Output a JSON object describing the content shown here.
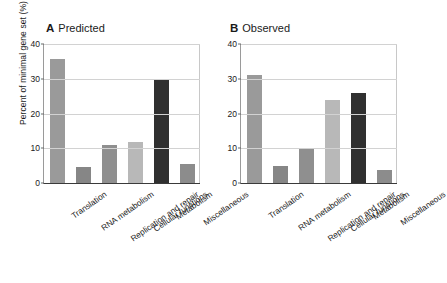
{
  "figure": {
    "background": "#ffffff",
    "y_axis_label": "Percent of minimal gene set (%)",
    "y_ticks": [
      "0",
      "10",
      "20",
      "30",
      "40"
    ]
  },
  "panels": [
    {
      "letter": "A",
      "title": "Predicted"
    },
    {
      "letter": "B",
      "title": "Observed"
    }
  ],
  "chart_data": [
    {
      "type": "bar",
      "title": "Predicted",
      "panel_letter": "A",
      "categories": [
        "Translation",
        "RNA metabolism",
        "Replication and repair",
        "Cellular functions",
        "Metabolism",
        "Miscellaneous"
      ],
      "values": [
        35.8,
        4.7,
        10.8,
        11.8,
        29.8,
        5.6
      ],
      "colors": [
        "#9a9a9a",
        "#868686",
        "#8f8f8f",
        "#b8b8b8",
        "#303030",
        "#8c8c8c"
      ],
      "xlabel": "",
      "ylabel": "Percent of minimal gene set (%)",
      "ylim": [
        0,
        40
      ],
      "yticks": [
        0,
        10,
        20,
        30,
        40
      ],
      "grid": true,
      "legend": "none"
    },
    {
      "type": "bar",
      "title": "Observed",
      "panel_letter": "B",
      "categories": [
        "Translation",
        "RNA metabolism",
        "Replication and repair",
        "Cellular functions",
        "Metabolism",
        "Miscellaneous"
      ],
      "values": [
        31.0,
        4.8,
        9.8,
        23.8,
        25.9,
        3.8
      ],
      "colors": [
        "#9a9a9a",
        "#868686",
        "#8f8f8f",
        "#b8b8b8",
        "#303030",
        "#8c8c8c"
      ],
      "xlabel": "",
      "ylabel": "Percent of minimal gene set (%)",
      "ylim": [
        0,
        40
      ],
      "yticks": [
        0,
        10,
        20,
        30,
        40
      ],
      "grid": true,
      "legend": "none"
    }
  ]
}
